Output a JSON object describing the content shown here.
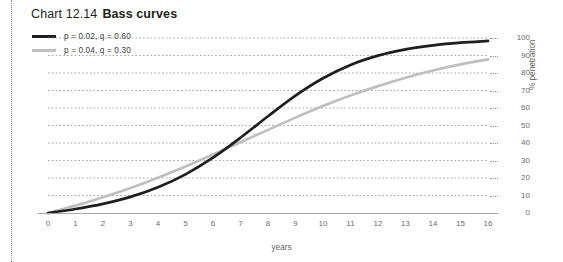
{
  "title": {
    "number": "Chart 12.14",
    "name": "Bass curves"
  },
  "axis_label_x": "years",
  "axis_label_y": "% penetration",
  "colors": {
    "series_dark": "#1f1f1f",
    "series_light": "#bfbfbf",
    "gridline": "#9a9a9a",
    "axis": "#a8a8a8",
    "tick_text": "#6d6d6d"
  },
  "legend": [
    {
      "label": "p = 0.02, q = 0.60",
      "color": "#1f1f1f"
    },
    {
      "label": "p = 0.04, q = 0.30",
      "color": "#bfbfbf"
    }
  ],
  "chart_data": {
    "type": "line",
    "xlabel": "years",
    "ylabel": "% penetration",
    "xlim": [
      0,
      16
    ],
    "ylim": [
      0,
      100
    ],
    "grid": "horizontal-dotted",
    "legend_position": "top-left",
    "x": [
      0,
      1,
      2,
      3,
      4,
      5,
      6,
      7,
      8,
      9,
      10,
      11,
      12,
      13,
      14,
      15,
      16
    ],
    "xticklabels": [
      "0",
      "1",
      "2",
      "3",
      "4",
      "5",
      "6",
      "7",
      "8",
      "9",
      "10",
      "11",
      "12",
      "13",
      "14",
      "15",
      "16"
    ],
    "yticklabels": [
      "0",
      "10",
      "20",
      "30",
      "40",
      "50",
      "60",
      "70",
      "80",
      "90",
      "100"
    ],
    "yticks": [
      0,
      10,
      20,
      30,
      40,
      50,
      60,
      70,
      80,
      90,
      100
    ],
    "series": [
      {
        "name": "p = 0.02, q = 0.60",
        "color": "#1f1f1f",
        "p": 0.02,
        "q": 0.6,
        "values": [
          0.0,
          2.3,
          5.2,
          9.2,
          14.7,
          22.1,
          31.6,
          43.0,
          55.3,
          67.1,
          77.0,
          84.6,
          89.9,
          93.5,
          95.8,
          97.3,
          98.3
        ]
      },
      {
        "name": "p = 0.04, q = 0.30",
        "color": "#bfbfbf",
        "p": 0.04,
        "q": 0.3,
        "values": [
          0.0,
          4.2,
          9.0,
          14.3,
          20.2,
          26.6,
          33.4,
          40.4,
          47.5,
          54.5,
          61.1,
          67.1,
          72.5,
          77.3,
          81.4,
          84.9,
          87.8
        ]
      }
    ],
    "annotations": [
      {
        "text": "curves cross at approximately 6 years, 44% penetration"
      }
    ]
  }
}
